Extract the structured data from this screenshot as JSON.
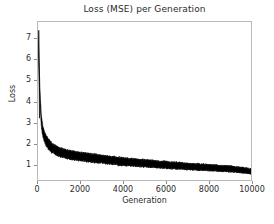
{
  "chart_data": {
    "type": "line",
    "title": "Loss (MSE) per Generation",
    "xlabel": "Generation",
    "ylabel": "Loss",
    "xlim": [
      0,
      10000
    ],
    "ylim": [
      0.25,
      7.8
    ],
    "xticks": [
      0,
      2000,
      4000,
      6000,
      8000,
      10000
    ],
    "xticklabels": [
      "0",
      "2000",
      "4000",
      "6000",
      "8000",
      "10000"
    ],
    "yticks": [
      1,
      2,
      3,
      4,
      5,
      6,
      7
    ],
    "yticklabels": [
      "1",
      "2",
      "3",
      "4",
      "5",
      "6",
      "7"
    ],
    "grid": false,
    "legend": null,
    "series": [
      {
        "name": "Loss (MSE)",
        "color": "#000000",
        "description": "Dense noisy per-generation MSE loss; steep exponential decay from ~7.4 then slow decline toward ~0.65",
        "x": [
          0,
          50,
          100,
          150,
          200,
          250,
          300,
          350,
          400,
          450,
          500,
          600,
          700,
          800,
          900,
          1000,
          1200,
          1400,
          1600,
          1800,
          2000,
          2250,
          2500,
          2750,
          3000,
          3250,
          3500,
          3750,
          4000,
          4250,
          4500,
          4750,
          5000,
          5250,
          5500,
          5750,
          6000,
          6250,
          6500,
          6750,
          7000,
          7250,
          7500,
          7750,
          8000,
          8250,
          8500,
          8750,
          9000,
          9250,
          9500,
          9750,
          10000
        ],
        "values": [
          7.4,
          5.6,
          4.05,
          3.15,
          2.72,
          2.48,
          2.32,
          2.2,
          2.1,
          2.02,
          1.95,
          1.84,
          1.76,
          1.7,
          1.64,
          1.59,
          1.52,
          1.47,
          1.43,
          1.4,
          1.37,
          1.33,
          1.3,
          1.27,
          1.24,
          1.21,
          1.18,
          1.15,
          1.13,
          1.11,
          1.09,
          1.07,
          1.05,
          1.03,
          1.01,
          0.99,
          0.97,
          0.95,
          0.94,
          0.92,
          0.9,
          0.89,
          0.87,
          0.86,
          0.84,
          0.83,
          0.81,
          0.8,
          0.78,
          0.76,
          0.73,
          0.7,
          0.66
        ],
        "noise_band": [
          0.02,
          0.26,
          0.3,
          0.28,
          0.26,
          0.25,
          0.24,
          0.24,
          0.23,
          0.23,
          0.22,
          0.22,
          0.21,
          0.21,
          0.21,
          0.2,
          0.2,
          0.2,
          0.2,
          0.19,
          0.19,
          0.19,
          0.19,
          0.19,
          0.18,
          0.18,
          0.18,
          0.18,
          0.18,
          0.17,
          0.17,
          0.17,
          0.17,
          0.17,
          0.16,
          0.16,
          0.16,
          0.16,
          0.16,
          0.15,
          0.15,
          0.15,
          0.15,
          0.15,
          0.14,
          0.14,
          0.14,
          0.14,
          0.14,
          0.13,
          0.13,
          0.13,
          0.12
        ]
      }
    ]
  }
}
